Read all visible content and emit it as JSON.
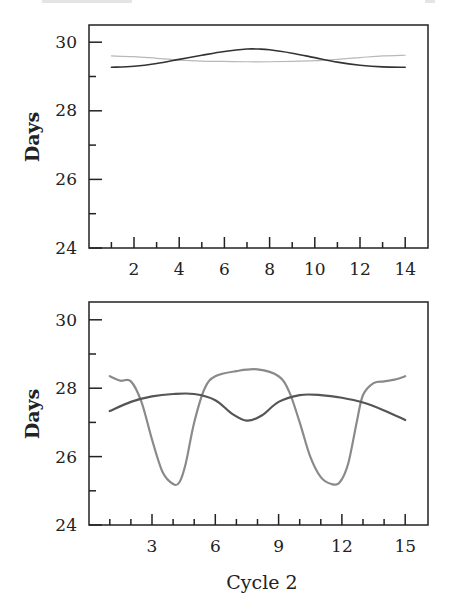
{
  "chart_data": [
    {
      "type": "line",
      "title": "",
      "xlabel": "",
      "ylabel": "Days",
      "xlim": [
        0.5,
        15
      ],
      "ylim": [
        24,
        30.5
      ],
      "xticks": [
        2,
        4,
        6,
        8,
        10,
        12,
        14
      ],
      "xticks_minor": [
        1,
        3,
        5,
        7,
        9,
        11,
        13
      ],
      "yticks": [
        24,
        26,
        28,
        30
      ],
      "yticks_minor": [
        25,
        27,
        29
      ],
      "grid": false,
      "legend": null,
      "series": [
        {
          "name": "series-dark",
          "color": "#333333",
          "width": 1.6,
          "x": [
            1,
            2,
            3,
            4,
            5,
            6,
            7,
            7.5,
            8,
            9,
            10,
            11,
            12,
            13,
            14
          ],
          "y": [
            29.27,
            29.3,
            29.38,
            29.5,
            29.62,
            29.73,
            29.8,
            29.8,
            29.78,
            29.68,
            29.55,
            29.42,
            29.33,
            29.28,
            29.27
          ]
        },
        {
          "name": "series-light",
          "color": "#b8b8b8",
          "width": 1.2,
          "x": [
            1,
            2,
            3,
            4,
            5,
            6,
            7,
            8,
            9,
            10,
            11,
            12,
            13,
            14
          ],
          "y": [
            29.6,
            29.58,
            29.53,
            29.48,
            29.45,
            29.44,
            29.43,
            29.43,
            29.44,
            29.46,
            29.5,
            29.55,
            29.6,
            29.62
          ]
        }
      ]
    },
    {
      "type": "line",
      "title": "",
      "xlabel": "Cycle 2",
      "ylabel": "Days",
      "xlim": [
        0,
        16
      ],
      "ylim": [
        24,
        30.5
      ],
      "xticks": [
        3,
        6,
        9,
        12,
        15
      ],
      "xticks_minor": [
        1,
        2,
        4,
        5,
        7,
        8,
        10,
        11,
        13,
        14
      ],
      "yticks": [
        24,
        26,
        28,
        30
      ],
      "yticks_minor": [
        25,
        27,
        29
      ],
      "grid": false,
      "legend": null,
      "series": [
        {
          "name": "series-dark",
          "color": "#555555",
          "width": 2.2,
          "x": [
            1,
            2,
            3,
            4,
            5,
            6,
            6.8,
            7.5,
            8.2,
            9,
            10,
            11,
            12,
            13,
            14,
            15
          ],
          "y": [
            27.33,
            27.6,
            27.76,
            27.83,
            27.83,
            27.65,
            27.25,
            27.05,
            27.2,
            27.6,
            27.8,
            27.8,
            27.72,
            27.58,
            27.35,
            27.07
          ]
        },
        {
          "name": "series-light",
          "color": "#8a8a8a",
          "width": 2.2,
          "x": [
            1,
            1.5,
            2,
            2.5,
            3,
            3.5,
            4,
            4.3,
            4.6,
            5,
            5.5,
            6,
            7,
            8,
            9,
            9.5,
            10,
            10.5,
            11,
            11.5,
            11.9,
            12.3,
            12.7,
            13,
            13.5,
            14,
            14.5,
            15
          ],
          "y": [
            28.35,
            28.22,
            28.2,
            27.6,
            26.5,
            25.55,
            25.2,
            25.25,
            25.8,
            27.0,
            28.0,
            28.35,
            28.5,
            28.55,
            28.35,
            27.9,
            27.0,
            26.0,
            25.4,
            25.2,
            25.25,
            25.8,
            27.0,
            27.8,
            28.15,
            28.2,
            28.25,
            28.35
          ]
        }
      ]
    }
  ],
  "panels": {
    "top": {
      "ylabel": "Days",
      "ytick_labels": [
        "30",
        "28",
        "26",
        "24"
      ],
      "xtick_labels": [
        "2",
        "4",
        "6",
        "8",
        "10",
        "12",
        "14"
      ]
    },
    "bottom": {
      "ylabel": "Days",
      "xlabel": "Cycle 2",
      "ytick_labels": [
        "30",
        "28",
        "26",
        "24"
      ],
      "xtick_labels": [
        "3",
        "6",
        "9",
        "12",
        "15"
      ]
    }
  }
}
